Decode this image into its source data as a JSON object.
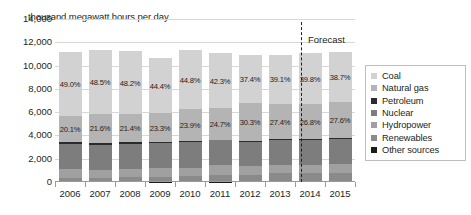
{
  "chart_data": {
    "type": "bar",
    "subtype": "stacked-percent-bar",
    "title": "",
    "ylabel": "thousand megawatt hours per day",
    "xlabel": "",
    "ylim": [
      0,
      14000
    ],
    "ytick_labels": [
      "14,000",
      "12,000",
      "10,000",
      "8,000",
      "6,000",
      "4,000",
      "2,000",
      "0"
    ],
    "ytick_values": [
      14000,
      12000,
      10000,
      8000,
      6000,
      4000,
      2000,
      0
    ],
    "grid": true,
    "legend_position": "right",
    "categories": [
      "2006",
      "2007",
      "2008",
      "2009",
      "2010",
      "2011",
      "2012",
      "2013",
      "2014",
      "2015"
    ],
    "totals": [
      11200,
      11350,
      11250,
      10650,
      11300,
      11050,
      10900,
      10950,
      11100,
      11200
    ],
    "series": [
      {
        "name": "Coal",
        "color": "#d2d2d2",
        "share_pct": [
          49.0,
          48.5,
          48.2,
          44.4,
          44.8,
          42.3,
          37.4,
          39.1,
          39.8,
          38.7
        ],
        "labels": [
          "49.0%",
          "48.5%",
          "48.2%",
          "44.4%",
          "44.8%",
          "42.3%",
          "37.4%",
          "39.1%",
          "39.8%",
          "38.7%"
        ]
      },
      {
        "name": "Natural gas",
        "color": "#b4b4b4",
        "share_pct": [
          20.1,
          21.6,
          21.4,
          23.3,
          23.9,
          24.7,
          30.3,
          27.4,
          26.8,
          27.6
        ],
        "labels": [
          "20.1%",
          "21.6%",
          "21.4%",
          "23.3%",
          "23.9%",
          "24.7%",
          "30.3%",
          "27.4%",
          "26.8%",
          "27.6%"
        ]
      },
      {
        "name": "Petroleum",
        "color": "#2b2b2b",
        "share_pct": [
          1.6,
          1.5,
          1.1,
          1.0,
          0.9,
          0.7,
          0.6,
          0.7,
          0.7,
          0.7
        ],
        "labels": [
          "",
          "",
          "",
          "",
          "",
          "",
          "",
          "",
          "",
          ""
        ]
      },
      {
        "name": "Nuclear",
        "color": "#7d7d7d",
        "share_pct": [
          19.4,
          19.4,
          19.6,
          20.2,
          19.6,
          19.3,
          19.0,
          19.4,
          19.5,
          19.5
        ],
        "labels": [
          "",
          "",
          "",
          "",
          "",
          "",
          "",
          "",
          "",
          ""
        ]
      },
      {
        "name": "Hydropower",
        "color": "#a0a0a0",
        "share_pct": [
          7.1,
          6.0,
          6.2,
          6.9,
          6.3,
          7.9,
          6.8,
          6.6,
          6.6,
          6.7
        ],
        "labels": [
          "",
          "",
          "",
          "",
          "",
          "",
          "",
          "",
          "",
          ""
        ]
      },
      {
        "name": "Renewables",
        "color": "#8a8a8a",
        "share_pct": [
          2.4,
          2.6,
          3.1,
          3.8,
          4.1,
          4.7,
          5.4,
          6.3,
          6.2,
          6.4
        ],
        "labels": [
          "",
          "",
          "",
          "",
          "",
          "",
          "",
          "",
          "",
          ""
        ]
      },
      {
        "name": "Other sources",
        "color": "#1c1c1c",
        "share_pct": [
          0.4,
          0.4,
          0.4,
          0.4,
          0.4,
          0.4,
          0.5,
          0.5,
          0.4,
          0.4
        ],
        "labels": [
          "",
          "",
          "",
          "",
          "",
          "",
          "",
          "",
          "",
          ""
        ]
      }
    ],
    "annotations": [
      {
        "text": "Forecast",
        "x_after_category": "2013"
      }
    ]
  },
  "legend": {
    "items": [
      {
        "label": "Coal",
        "color": "#d2d2d2"
      },
      {
        "label": "Natural gas",
        "color": "#b4b4b4"
      },
      {
        "label": "Petroleum",
        "color": "#2b2b2b"
      },
      {
        "label": "Nuclear",
        "color": "#7d7d7d"
      },
      {
        "label": "Hydropower",
        "color": "#a0a0a0"
      },
      {
        "label": "Renewables",
        "color": "#8a8a8a"
      },
      {
        "label": "Other sources",
        "color": "#1c1c1c"
      }
    ]
  },
  "forecast": {
    "label": "Forecast"
  }
}
